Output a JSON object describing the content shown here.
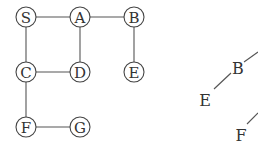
{
  "graph": {
    "node_radius": 10,
    "nodes": [
      {
        "id": "S",
        "label": "S",
        "x": 26,
        "y": 17
      },
      {
        "id": "A",
        "label": "A",
        "x": 80,
        "y": 17
      },
      {
        "id": "B",
        "label": "B",
        "x": 134,
        "y": 17
      },
      {
        "id": "C",
        "label": "C",
        "x": 26,
        "y": 72
      },
      {
        "id": "D",
        "label": "D",
        "x": 80,
        "y": 72
      },
      {
        "id": "E",
        "label": "E",
        "x": 134,
        "y": 72
      },
      {
        "id": "F",
        "label": "F",
        "x": 26,
        "y": 127
      },
      {
        "id": "G",
        "label": "G",
        "x": 80,
        "y": 127
      }
    ],
    "edges": [
      [
        "S",
        "A"
      ],
      [
        "A",
        "B"
      ],
      [
        "S",
        "C"
      ],
      [
        "A",
        "D"
      ],
      [
        "C",
        "D"
      ],
      [
        "B",
        "E"
      ],
      [
        "C",
        "F"
      ],
      [
        "F",
        "G"
      ]
    ]
  },
  "tree": {
    "nodes": [
      {
        "id": "B",
        "label": "B",
        "x": 238,
        "y": 74
      },
      {
        "id": "E",
        "label": "E",
        "x": 205,
        "y": 106
      },
      {
        "id": "F",
        "label": "F",
        "x": 241,
        "y": 141
      }
    ],
    "edges": [
      {
        "x1": 244,
        "y1": 62,
        "x2": 258,
        "y2": 52
      },
      {
        "x1": 231,
        "y1": 73,
        "x2": 214,
        "y2": 89
      },
      {
        "x1": 247,
        "y1": 124,
        "x2": 258,
        "y2": 113
      }
    ]
  }
}
